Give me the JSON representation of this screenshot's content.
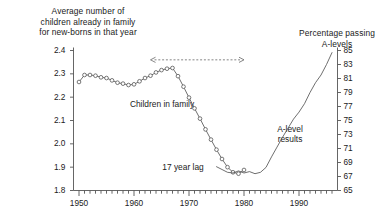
{
  "left_axis": {
    "title": "Average number of\nchildren already in family\nfor new-borns in that year",
    "ticks": [
      "1.8",
      "1.9",
      "2.0",
      "2.1",
      "2.2",
      "2.3",
      "2.4"
    ]
  },
  "right_axis": {
    "title": "Percentage passing\nA-levels",
    "ticks": [
      "85",
      "83",
      "81",
      "79",
      "77",
      "75",
      "73",
      "71",
      "69",
      "67",
      "65"
    ]
  },
  "x_axis": {
    "ticks": [
      "1950",
      "1960",
      "1970",
      "1980",
      "1990"
    ]
  },
  "labels": {
    "children_series": "Children in family",
    "alevel_series": "A-level\nresults",
    "lag_annotation": "17 year lag"
  },
  "colors": {
    "ink": "#1a1a1a",
    "axis": "#555555",
    "marker_stroke": "#555555",
    "marker_fill": "#ffffff",
    "curve": "#555555",
    "annotation": "#666666"
  },
  "chart_data": {
    "type": "line",
    "title": "",
    "subtitle": "",
    "xlabel": "",
    "ylabel": "Average number of children already in family for new-borns in that year",
    "y2label": "Percentage passing A-levels",
    "xlim": [
      1949,
      1997
    ],
    "ylim": [
      2.4,
      1.8
    ],
    "y2lim": [
      65,
      85
    ],
    "grid": false,
    "legend": "none",
    "annotations": [
      {
        "text": "17 year lag",
        "type": "double-headed-dashed-arrow",
        "x_from": 1963,
        "x_to": 1980,
        "y_value": 2.36
      }
    ],
    "series": [
      {
        "name": "Children in family",
        "axis": "left",
        "marker": "open-circle",
        "line": "solid-thin",
        "x": [
          1950,
          1951,
          1952,
          1953,
          1954,
          1955,
          1956,
          1957,
          1958,
          1959,
          1960,
          1961,
          1962,
          1963,
          1964,
          1965,
          1966,
          1967,
          1968,
          1969,
          1970,
          1971,
          1972,
          1973,
          1974,
          1975,
          1976,
          1977,
          1978,
          1979,
          1980
        ],
        "values": [
          2.265,
          2.295,
          2.295,
          2.292,
          2.285,
          2.282,
          2.272,
          2.262,
          2.258,
          2.252,
          2.255,
          2.268,
          2.282,
          2.292,
          2.306,
          2.316,
          2.322,
          2.325,
          2.29,
          2.245,
          2.198,
          2.152,
          2.108,
          2.062,
          2.018,
          1.975,
          1.935,
          1.9,
          1.878,
          1.872,
          1.888
        ]
      },
      {
        "name": "A-level results",
        "axis": "right",
        "marker": "none",
        "line": "solid-thin",
        "x": [
          1975,
          1976,
          1977,
          1978,
          1979,
          1980,
          1981,
          1982,
          1983,
          1984,
          1985,
          1986,
          1987,
          1988,
          1989,
          1990,
          1991,
          1992,
          1993,
          1994,
          1995,
          1996
        ],
        "values": [
          68.4,
          68.0,
          67.6,
          67.5,
          67.8,
          67.5,
          67.7,
          67.4,
          67.6,
          68.3,
          69.8,
          71.2,
          72.6,
          73.9,
          75.2,
          76.2,
          77.4,
          79.0,
          80.4,
          81.5,
          83.0,
          84.7
        ]
      }
    ]
  }
}
